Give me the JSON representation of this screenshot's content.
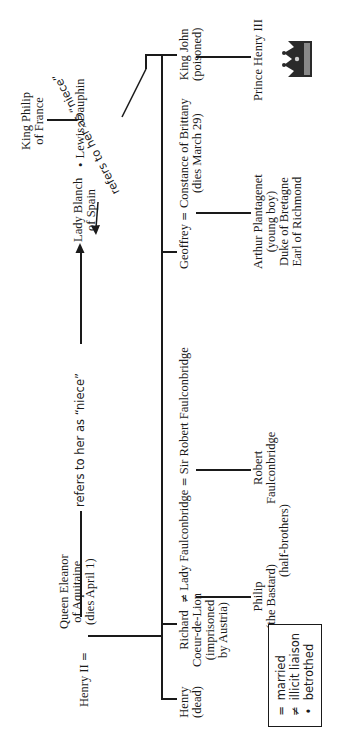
{
  "diagram": {
    "type": "family-tree",
    "orientation": "rotated-90-ccw",
    "nodes": {
      "henry_ii": {
        "name": "Henry II"
      },
      "queen_eleanor": {
        "lines": [
          "Queen Eleanor",
          "of Aquitaine",
          "(dies April 1)"
        ]
      },
      "lady_blanch": {
        "lines": [
          "Lady Blanch",
          "of Spain"
        ]
      },
      "lewis": {
        "name": "Lewis, Dauphin"
      },
      "king_philip": {
        "lines": [
          "King Philip",
          "of France"
        ]
      },
      "henry_dead": {
        "lines": [
          "Henry",
          "(dead)"
        ]
      },
      "richard": {
        "lines": [
          "Richard",
          "Coeur-de-Lion",
          "(imprisoned",
          "by Austria)"
        ]
      },
      "lady_faulconbridge": {
        "name": "Lady Faulconbridge"
      },
      "sir_robert": {
        "name": "Sir Robert Faulconbridge"
      },
      "philip_bastard": {
        "lines": [
          "Philip",
          "(the Bastard)"
        ]
      },
      "robert_f": {
        "lines": [
          "Robert",
          "Faulconbridge"
        ]
      },
      "half_brothers": {
        "name": "(half-brothers)"
      },
      "geoffrey": {
        "name": "Geoffrey"
      },
      "constance": {
        "lines": [
          "Constance of Brittany",
          "(dies March 29)"
        ]
      },
      "arthur": {
        "lines": [
          "Arthur Plantagenet",
          "(young boy)",
          "Duke of Bretagne",
          "Earl of Richmond"
        ]
      },
      "king_john": {
        "lines": [
          "King John",
          "(poisoned)"
        ]
      },
      "prince_henry": {
        "name": "Prince Henry III"
      }
    },
    "relations": {
      "married_symbol": "=",
      "illicit_symbol": "≠",
      "betrothed_symbol": "•"
    },
    "annotations": {
      "eleanor_to_blanch": "refers to her as “niece”",
      "john_to_blanch": "refers to her as “niece”"
    },
    "legend": {
      "items": [
        {
          "symbol": "=",
          "label": "married"
        },
        {
          "symbol": "≠",
          "label": "illicit liaison"
        },
        {
          "symbol": "•",
          "label": "betrothed"
        }
      ]
    },
    "decoration": {
      "crown_icon": "crown"
    }
  }
}
